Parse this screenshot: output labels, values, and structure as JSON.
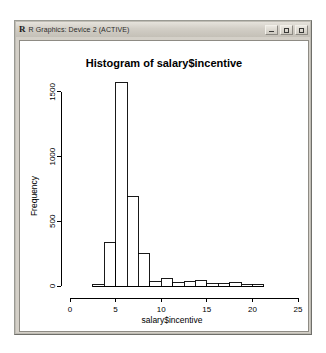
{
  "window": {
    "title": "R Graphics: Device 2 (ACTIVE)",
    "logo": "r-logo",
    "controls": [
      {
        "name": "minimize-button",
        "label": "_"
      },
      {
        "name": "maximize-button",
        "label": "□"
      },
      {
        "name": "close-button",
        "label": "X"
      }
    ],
    "colors": {
      "titlebar": "#d2cec6",
      "frame": "#d4d0c8",
      "canvas": "#ffffff",
      "ink": "#000000"
    }
  },
  "chart_data": {
    "type": "bar",
    "title": "Histogram of salary$incentive",
    "xlabel": "salary$incentive",
    "ylabel": "Frequency",
    "xlim": [
      0,
      25
    ],
    "ylim": [
      0,
      1600
    ],
    "grid": false,
    "legend": null,
    "xticks": [
      0,
      5,
      10,
      15,
      20,
      25
    ],
    "yticks": [
      0,
      500,
      1000,
      1500
    ],
    "bin_width": 1.25,
    "bins": [
      {
        "x0": 2.5,
        "x1": 3.75,
        "value": 10
      },
      {
        "x0": 3.75,
        "x1": 5.0,
        "value": 340
      },
      {
        "x0": 5.0,
        "x1": 6.25,
        "value": 1570
      },
      {
        "x0": 6.25,
        "x1": 7.5,
        "value": 690
      },
      {
        "x0": 7.5,
        "x1": 8.75,
        "value": 250
      },
      {
        "x0": 8.75,
        "x1": 10.0,
        "value": 35
      },
      {
        "x0": 10.0,
        "x1": 11.25,
        "value": 60
      },
      {
        "x0": 11.25,
        "x1": 12.5,
        "value": 25
      },
      {
        "x0": 12.5,
        "x1": 13.75,
        "value": 35
      },
      {
        "x0": 13.75,
        "x1": 15.0,
        "value": 45
      },
      {
        "x0": 15.0,
        "x1": 16.25,
        "value": 20
      },
      {
        "x0": 16.25,
        "x1": 17.5,
        "value": 18
      },
      {
        "x0": 17.5,
        "x1": 18.75,
        "value": 30
      },
      {
        "x0": 18.75,
        "x1": 20.0,
        "value": 12
      },
      {
        "x0": 20.0,
        "x1": 21.25,
        "value": 8
      }
    ],
    "categories": [
      "2.5-3.75",
      "3.75-5",
      "5-6.25",
      "6.25-7.5",
      "7.5-8.75",
      "8.75-10",
      "10-11.25",
      "11.25-12.5",
      "12.5-13.75",
      "13.75-15",
      "15-16.25",
      "16.25-17.5",
      "17.5-18.75",
      "18.75-20",
      "20-21.25"
    ],
    "values": [
      10,
      340,
      1570,
      690,
      250,
      35,
      60,
      25,
      35,
      45,
      20,
      18,
      30,
      12,
      8
    ]
  }
}
